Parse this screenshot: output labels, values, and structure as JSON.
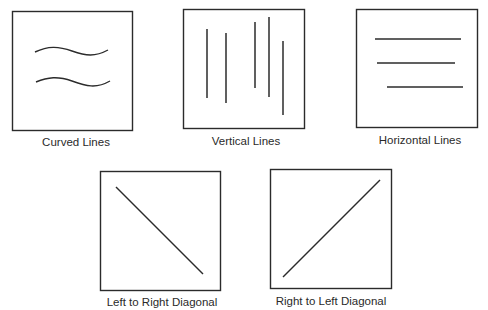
{
  "figure": {
    "stroke_color": "#2b2b2b",
    "background": "#ffffff",
    "panels": [
      {
        "id": "curved",
        "label": "Curved Lines",
        "line_type": "curved",
        "box": {
          "x": 12,
          "y": 11,
          "w": 121,
          "h": 120
        },
        "lines": 2
      },
      {
        "id": "vertical",
        "label": "Vertical Lines",
        "line_type": "vertical",
        "box": {
          "x": 183,
          "y": 9,
          "w": 122,
          "h": 120
        },
        "lines": 5
      },
      {
        "id": "horizontal",
        "label": "Horizontal Lines",
        "line_type": "horizontal",
        "box": {
          "x": 356,
          "y": 9,
          "w": 122,
          "h": 119
        },
        "lines": 3
      },
      {
        "id": "left-to-right-diagonal",
        "label": "Left to Right Diagonal",
        "line_type": "diagonal-descending",
        "box": {
          "x": 100,
          "y": 171,
          "w": 121,
          "h": 120
        },
        "lines": 1
      },
      {
        "id": "right-to-left-diagonal",
        "label": "Right to Left Diagonal",
        "line_type": "diagonal-ascending",
        "box": {
          "x": 270,
          "y": 169,
          "w": 122,
          "h": 120
        },
        "lines": 1
      }
    ]
  }
}
